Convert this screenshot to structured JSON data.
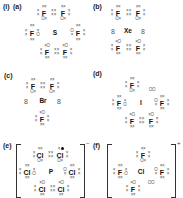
{
  "title_marker": "(i)",
  "panels": [
    {
      "id": "a",
      "label": "(a)",
      "center": "S",
      "atoms": [
        "F",
        "F",
        "F",
        "F",
        "F",
        "F"
      ]
    },
    {
      "id": "b",
      "label": "(b)",
      "center": "Xe",
      "atoms": [
        "F",
        "F",
        "F",
        "F"
      ],
      "lone_pair_symbol": "8"
    },
    {
      "id": "c",
      "label": "(c)",
      "center": "Br",
      "atoms": [
        "F",
        "F",
        "F"
      ],
      "lone_pair_symbol": "8"
    },
    {
      "id": "d",
      "label": "(d)",
      "center": "I",
      "atoms": [
        "F",
        "F",
        "F",
        "F",
        "F"
      ],
      "lone_pair_symbol": "OO"
    },
    {
      "id": "e",
      "label": "(e)",
      "center": "P",
      "atoms": [
        "Cl",
        "Cl",
        "Cl",
        "Cl",
        "Cl",
        "Cl"
      ],
      "charge": "−"
    },
    {
      "id": "f",
      "label": "(f)",
      "center": "Cl",
      "atoms": [
        "F",
        "F",
        "F",
        "F"
      ],
      "lone_pair_symbol": "OO",
      "charge": "+"
    }
  ],
  "electron_marks": {
    "cross_pair": "××",
    "shared_pair": "O×",
    "shared_pair_alt": "×O",
    "lone_pair_circles": "OO"
  }
}
